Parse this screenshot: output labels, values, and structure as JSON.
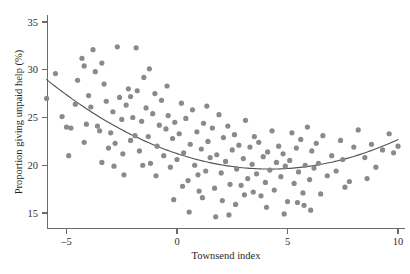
{
  "chart_data": {
    "type": "scatter",
    "title": "",
    "xlabel": "Townsend index",
    "ylabel": "Proportion giving unpaid help (%)",
    "xlim": [
      -6.4,
      10.5
    ],
    "ylim": [
      13.2,
      35.8
    ],
    "xticks": [
      -5,
      0,
      5,
      10
    ],
    "xticklabels": [
      "–5",
      "0",
      "5",
      "10"
    ],
    "yticks": [
      15,
      20,
      25,
      30,
      35
    ],
    "yticklabels": [
      "15",
      "20",
      "25",
      "30",
      "35"
    ],
    "grid": false,
    "legend": null,
    "point_color": "#8a8a8a",
    "curve_color": "#555555",
    "axis_color": "#6b6b6b",
    "series": [
      {
        "name": "Electoral wards",
        "marker": "circle",
        "points": [
          [
            -5.9,
            27.0
          ],
          [
            -5.5,
            29.6
          ],
          [
            -5.2,
            25.1
          ],
          [
            -5.0,
            24.0
          ],
          [
            -4.8,
            23.9
          ],
          [
            -4.6,
            26.4
          ],
          [
            -4.5,
            28.9
          ],
          [
            -4.3,
            31.2
          ],
          [
            -4.2,
            30.4
          ],
          [
            -4.1,
            24.3
          ],
          [
            -4.0,
            27.3
          ],
          [
            -3.9,
            26.1
          ],
          [
            -3.8,
            32.1
          ],
          [
            -3.7,
            29.8
          ],
          [
            -3.6,
            24.1
          ],
          [
            -3.5,
            23.6
          ],
          [
            -3.4,
            30.7
          ],
          [
            -3.3,
            28.5
          ],
          [
            -3.2,
            26.7
          ],
          [
            -3.1,
            21.8
          ],
          [
            -3.0,
            23.4
          ],
          [
            -2.9,
            25.6
          ],
          [
            -2.8,
            22.3
          ],
          [
            -2.7,
            32.4
          ],
          [
            -2.6,
            27.1
          ],
          [
            -2.5,
            24.8
          ],
          [
            -2.4,
            19.0
          ],
          [
            -2.3,
            26.3
          ],
          [
            -2.2,
            28.0
          ],
          [
            -2.1,
            22.6
          ],
          [
            -2.0,
            25.0
          ],
          [
            -1.9,
            23.1
          ],
          [
            -1.85,
            32.3
          ],
          [
            -1.8,
            27.8
          ],
          [
            -1.7,
            21.5
          ],
          [
            -1.6,
            24.6
          ],
          [
            -1.5,
            29.2
          ],
          [
            -1.4,
            26.0
          ],
          [
            -1.3,
            23.0
          ],
          [
            -1.2,
            20.2
          ],
          [
            -1.1,
            25.4
          ],
          [
            -1.0,
            27.5
          ],
          [
            -0.9,
            22.0
          ],
          [
            -0.8,
            24.2
          ],
          [
            -0.7,
            26.8
          ],
          [
            -0.6,
            21.0
          ],
          [
            -0.5,
            23.8
          ],
          [
            -0.45,
            28.3
          ],
          [
            -0.4,
            25.2
          ],
          [
            -0.3,
            19.8
          ],
          [
            -0.2,
            22.8
          ],
          [
            -0.1,
            24.5
          ],
          [
            0.0,
            20.6
          ],
          [
            0.1,
            23.3
          ],
          [
            0.2,
            26.5
          ],
          [
            0.3,
            21.3
          ],
          [
            0.4,
            24.9
          ],
          [
            0.5,
            18.4
          ],
          [
            0.6,
            22.2
          ],
          [
            0.7,
            25.8
          ],
          [
            0.8,
            20.0
          ],
          [
            0.9,
            23.5
          ],
          [
            1.0,
            17.3
          ],
          [
            1.1,
            21.7
          ],
          [
            1.2,
            24.4
          ],
          [
            1.3,
            19.4
          ],
          [
            1.35,
            26.2
          ],
          [
            1.4,
            22.5
          ],
          [
            1.5,
            20.8
          ],
          [
            1.6,
            23.9
          ],
          [
            1.7,
            17.6
          ],
          [
            1.8,
            21.1
          ],
          [
            1.9,
            25.3
          ],
          [
            2.0,
            19.2
          ],
          [
            2.1,
            22.9
          ],
          [
            2.2,
            20.4
          ],
          [
            2.3,
            24.1
          ],
          [
            2.4,
            18.0
          ],
          [
            2.5,
            21.6
          ],
          [
            2.6,
            23.2
          ],
          [
            2.7,
            19.6
          ],
          [
            2.8,
            22.1
          ],
          [
            2.9,
            17.9
          ],
          [
            3.0,
            20.7
          ],
          [
            3.1,
            24.7
          ],
          [
            3.2,
            18.6
          ],
          [
            3.3,
            21.9
          ],
          [
            3.4,
            20.1
          ],
          [
            3.5,
            23.0
          ],
          [
            3.6,
            19.1
          ],
          [
            3.7,
            22.4
          ],
          [
            3.8,
            16.8
          ],
          [
            3.9,
            20.9
          ],
          [
            4.0,
            18.2
          ],
          [
            4.1,
            21.4
          ],
          [
            4.2,
            19.5
          ],
          [
            4.3,
            23.6
          ],
          [
            4.4,
            17.4
          ],
          [
            4.5,
            20.3
          ],
          [
            4.6,
            22.0
          ],
          [
            4.7,
            18.8
          ],
          [
            4.8,
            21.2
          ],
          [
            4.9,
            19.9
          ],
          [
            5.0,
            16.2
          ],
          [
            5.1,
            20.5
          ],
          [
            5.2,
            23.4
          ],
          [
            5.3,
            18.1
          ],
          [
            5.4,
            21.8
          ],
          [
            5.5,
            19.3
          ],
          [
            5.6,
            22.7
          ],
          [
            5.7,
            17.1
          ],
          [
            5.8,
            20.0
          ],
          [
            5.9,
            24.0
          ],
          [
            6.0,
            18.5
          ],
          [
            6.1,
            21.5
          ],
          [
            6.2,
            19.7
          ],
          [
            6.3,
            22.3
          ],
          [
            6.4,
            20.2
          ],
          [
            6.6,
            23.1
          ],
          [
            6.8,
            18.9
          ],
          [
            7.0,
            21.0
          ],
          [
            7.2,
            19.4
          ],
          [
            7.4,
            22.6
          ],
          [
            7.5,
            20.6
          ],
          [
            7.8,
            18.3
          ],
          [
            8.0,
            21.9
          ],
          [
            8.2,
            23.7
          ],
          [
            8.5,
            20.8
          ],
          [
            8.8,
            22.2
          ],
          [
            9.0,
            19.8
          ],
          [
            9.3,
            21.6
          ],
          [
            9.6,
            23.3
          ],
          [
            9.8,
            21.3
          ],
          [
            10.0,
            22.0
          ],
          [
            -4.9,
            21.0
          ],
          [
            -4.2,
            22.4
          ],
          [
            -3.4,
            20.3
          ],
          [
            -2.85,
            19.9
          ],
          [
            -2.1,
            27.2
          ],
          [
            -1.25,
            30.1
          ],
          [
            -0.95,
            18.9
          ],
          [
            0.25,
            17.8
          ],
          [
            1.15,
            16.6
          ],
          [
            2.05,
            16.3
          ],
          [
            3.05,
            16.9
          ],
          [
            4.05,
            15.6
          ],
          [
            4.85,
            14.9
          ],
          [
            5.45,
            16.1
          ],
          [
            6.05,
            15.3
          ],
          [
            0.55,
            15.1
          ],
          [
            1.75,
            14.6
          ],
          [
            2.65,
            15.9
          ],
          [
            -0.15,
            16.4
          ],
          [
            0.95,
            19.0
          ],
          [
            3.45,
            17.2
          ],
          [
            2.35,
            14.8
          ],
          [
            -1.55,
            20.0
          ],
          [
            -2.45,
            21.2
          ],
          [
            6.5,
            17.0
          ],
          [
            7.6,
            17.7
          ],
          [
            8.6,
            18.6
          ],
          [
            5.75,
            15.8
          ]
        ]
      }
    ],
    "fit_curve": {
      "name": "quadratic fit",
      "description": "U-shaped quadratic regression line",
      "vertex": [
        4.2,
        19.6
      ],
      "x_start": -5.9,
      "y_start": 29.9,
      "x_end": 10.0,
      "y_end": 22.1,
      "coefficients": {
        "a": 0.0918,
        "b": -0.771,
        "c": 21.22
      }
    }
  }
}
